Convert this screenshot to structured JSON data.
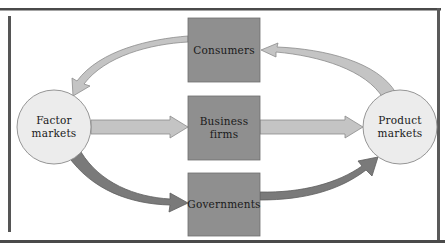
{
  "diagram": {
    "type": "circular-flow",
    "nodes": {
      "consumers": {
        "label": "Consumers",
        "shape": "box"
      },
      "business_firms": {
        "label_line1": "Business",
        "label_line2": "firms",
        "shape": "box"
      },
      "governments": {
        "label": "Governments",
        "shape": "box"
      },
      "factor_markets": {
        "label_line1": "Factor",
        "label_line2": "markets",
        "shape": "circle"
      },
      "product_markets": {
        "label_line1": "Product",
        "label_line2": "markets",
        "shape": "circle"
      }
    },
    "edges": [
      {
        "from": "Consumers",
        "to": "Factor markets",
        "style": "light-curved"
      },
      {
        "from": "Product markets",
        "to": "Consumers",
        "style": "light-curved"
      },
      {
        "from": "Factor markets",
        "to": "Business firms",
        "style": "light-straight"
      },
      {
        "from": "Business firms",
        "to": "Product markets",
        "style": "light-straight"
      },
      {
        "from": "Factor markets",
        "to": "Governments",
        "style": "dark-curved"
      },
      {
        "from": "Governments",
        "to": "Product markets",
        "style": "dark-curved"
      }
    ],
    "colors": {
      "box_fill": "#8f8f8f",
      "box_border": "#6e6e6e",
      "circle_fill": "#ececec",
      "circle_border": "#8a8a8a",
      "arrow_light": "#c4c4c4",
      "arrow_light_border": "#8c8c8c",
      "arrow_dark": "#7a7a7a",
      "arrow_dark_border": "#5e5e5e",
      "frame": "#4a4a4a"
    }
  }
}
